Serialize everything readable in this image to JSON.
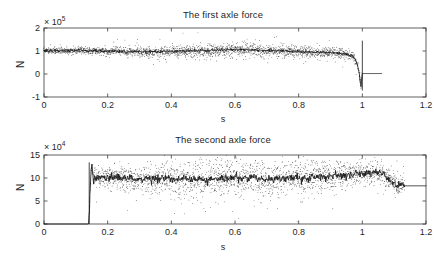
{
  "figure": {
    "width": 446,
    "height": 263,
    "background": "#ffffff",
    "line_color": "#161616",
    "dot_color": "#2b2b2b",
    "axis_color": "#3a3a3a"
  },
  "chart_data": [
    {
      "type": "line",
      "id": "first-axle-force",
      "title": "The first axle force",
      "xlabel": "s",
      "ylabel": "N",
      "y_exponent_label": "× 10",
      "y_exponent_power": "5",
      "y_exponent_value": 100000,
      "xlim": [
        0,
        1.2
      ],
      "ylim": [
        -1,
        2
      ],
      "xticks": [
        0,
        0.2,
        0.4,
        0.6,
        0.8,
        1,
        1.2
      ],
      "xticklabels": [
        "0",
        "0.2",
        "0.4",
        "0.6",
        "0.8",
        "1",
        "1.2"
      ],
      "yticks": [
        -1,
        0,
        1,
        2
      ],
      "yticklabels": [
        "-1",
        "0",
        "1",
        "2"
      ],
      "grid": false,
      "legend": null,
      "series": [
        {
          "name": "mean force",
          "style": "solid-line",
          "description": "Dense quasi-steady signal near 1.0e5 N from t=0 to t=1.0, then abrupt drop to ~0 and flat to t=1.13",
          "x": [
            0.0,
            0.005,
            0.01,
            0.015,
            0.02,
            0.025,
            0.03,
            0.035,
            0.04,
            0.045,
            0.05,
            0.055,
            0.06,
            0.065,
            0.07,
            0.075,
            0.08,
            0.085,
            0.09,
            0.095,
            0.1,
            0.105,
            0.11,
            0.115,
            0.12,
            0.125,
            0.13,
            0.135,
            0.14,
            0.145,
            0.15,
            0.16,
            0.17,
            0.18,
            0.19,
            0.2,
            0.21,
            0.22,
            0.23,
            0.24,
            0.25,
            0.26,
            0.27,
            0.28,
            0.29,
            0.3,
            0.31,
            0.32,
            0.33,
            0.34,
            0.35,
            0.36,
            0.37,
            0.38,
            0.39,
            0.4,
            0.41,
            0.42,
            0.43,
            0.44,
            0.45,
            0.46,
            0.47,
            0.48,
            0.49,
            0.5,
            0.51,
            0.52,
            0.53,
            0.54,
            0.55,
            0.56,
            0.57,
            0.58,
            0.59,
            0.6,
            0.61,
            0.62,
            0.63,
            0.64,
            0.65,
            0.66,
            0.67,
            0.68,
            0.69,
            0.7,
            0.71,
            0.72,
            0.73,
            0.74,
            0.75,
            0.76,
            0.77,
            0.78,
            0.79,
            0.8,
            0.81,
            0.82,
            0.83,
            0.84,
            0.85,
            0.86,
            0.87,
            0.88,
            0.89,
            0.9,
            0.91,
            0.92,
            0.93,
            0.94,
            0.95,
            0.96,
            0.97,
            0.975,
            0.98,
            0.985,
            0.99,
            0.993,
            0.996,
            0.998,
            1.0,
            1.002,
            1.004,
            1.006,
            1.01,
            1.02,
            1.04,
            1.06,
            1.08,
            1.1,
            1.12,
            1.133
          ],
          "y": [
            1.02,
            1.0,
            1.05,
            0.97,
            1.03,
            0.99,
            1.04,
            1.0,
            1.02,
            0.98,
            1.01,
            1.03,
            0.99,
            1.02,
            1.0,
            1.01,
            0.99,
            1.02,
            1.0,
            1.03,
            1.01,
            1.0,
            1.04,
            1.02,
            1.05,
            1.03,
            1.01,
            1.0,
            0.99,
            1.01,
            1.0,
            1.02,
            0.99,
            1.01,
            1.0,
            0.98,
            1.0,
            0.99,
            1.01,
            0.98,
            1.0,
            0.97,
            0.99,
            0.96,
            0.98,
            0.96,
            0.97,
            0.95,
            0.97,
            0.96,
            0.98,
            0.96,
            0.97,
            0.99,
            0.97,
            0.98,
            0.96,
            0.98,
            1.0,
            0.98,
            0.99,
            1.01,
            0.99,
            1.02,
            1.0,
            1.03,
            1.01,
            1.04,
            1.02,
            1.05,
            1.03,
            1.06,
            1.04,
            1.07,
            1.05,
            1.08,
            1.06,
            1.07,
            1.05,
            1.06,
            1.04,
            1.05,
            1.03,
            1.04,
            1.02,
            1.03,
            1.01,
            1.02,
            1.0,
            1.01,
            0.99,
            1.0,
            0.98,
            0.99,
            0.97,
            0.98,
            0.96,
            0.97,
            0.95,
            0.96,
            0.94,
            0.95,
            0.93,
            0.94,
            0.92,
            0.93,
            0.91,
            0.92,
            0.9,
            0.88,
            0.86,
            0.82,
            0.76,
            0.68,
            0.55,
            0.35,
            0.05,
            -0.3,
            -0.55,
            -0.15,
            0.02,
            0.02,
            0.02,
            0.02,
            0.02,
            0.02,
            0.02,
            0.02
          ],
          "scatter_band_halfwidth": 0.09,
          "scatter_note": "dotted cloud of individual samples straddles the mean line, widest (~±0.18e5) between t=0.45 and t=0.75"
        }
      ]
    },
    {
      "type": "line",
      "id": "second-axle-force",
      "title": "The second axle force",
      "xlabel": "s",
      "ylabel": "N",
      "y_exponent_label": "× 10",
      "y_exponent_power": "4",
      "y_exponent_value": 10000,
      "xlim": [
        0,
        1.2
      ],
      "ylim": [
        0,
        15
      ],
      "xticks": [
        0,
        0.2,
        0.4,
        0.6,
        0.8,
        1,
        1.2
      ],
      "xticklabels": [
        "0",
        "0.2",
        "0.4",
        "0.6",
        "0.8",
        "1",
        "1.2"
      ],
      "yticks": [
        0,
        5,
        10,
        15
      ],
      "yticklabels": [
        "0",
        "5",
        "10",
        "15"
      ],
      "grid": false,
      "legend": null,
      "series": [
        {
          "name": "mean force",
          "style": "solid-line",
          "description": "Zero until t=0.14, then abrupt rise with overshoot to ~13, settling around 9.5-10.5e4 N until t=1.13",
          "x": [
            0.0,
            0.135,
            0.14,
            0.142,
            0.145,
            0.148,
            0.15,
            0.153,
            0.156,
            0.16,
            0.165,
            0.17,
            0.175,
            0.18,
            0.19,
            0.2,
            0.21,
            0.22,
            0.23,
            0.24,
            0.25,
            0.26,
            0.27,
            0.28,
            0.29,
            0.3,
            0.31,
            0.32,
            0.33,
            0.34,
            0.35,
            0.36,
            0.37,
            0.38,
            0.39,
            0.4,
            0.41,
            0.42,
            0.43,
            0.44,
            0.45,
            0.46,
            0.47,
            0.48,
            0.49,
            0.5,
            0.51,
            0.52,
            0.53,
            0.54,
            0.55,
            0.56,
            0.57,
            0.58,
            0.59,
            0.6,
            0.61,
            0.62,
            0.63,
            0.64,
            0.65,
            0.66,
            0.67,
            0.68,
            0.69,
            0.7,
            0.71,
            0.72,
            0.73,
            0.74,
            0.75,
            0.76,
            0.77,
            0.78,
            0.79,
            0.8,
            0.81,
            0.82,
            0.83,
            0.84,
            0.85,
            0.86,
            0.87,
            0.88,
            0.89,
            0.9,
            0.91,
            0.92,
            0.93,
            0.94,
            0.95,
            0.96,
            0.97,
            0.98,
            0.99,
            1.0,
            1.01,
            1.02,
            1.03,
            1.04,
            1.05,
            1.06,
            1.07,
            1.08,
            1.09,
            1.1,
            1.11,
            1.12,
            1.125,
            1.13,
            1.133
          ],
          "y": [
            0.0,
            0.0,
            0.0,
            2.5,
            7.0,
            11.5,
            13.2,
            11.0,
            9.0,
            10.6,
            9.6,
            10.4,
            9.8,
            10.2,
            10.0,
            10.3,
            10.1,
            10.4,
            9.9,
            10.2,
            10.0,
            9.7,
            10.5,
            9.6,
            9.4,
            9.9,
            9.7,
            10.1,
            9.8,
            9.5,
            9.9,
            9.6,
            10.0,
            9.7,
            10.1,
            9.8,
            9.5,
            9.9,
            9.6,
            10.0,
            9.7,
            9.4,
            9.8,
            9.6,
            10.0,
            9.7,
            9.5,
            9.9,
            9.7,
            10.1,
            9.8,
            10.2,
            9.9,
            10.3,
            10.0,
            10.4,
            10.1,
            9.8,
            10.2,
            9.9,
            10.3,
            10.0,
            9.7,
            10.1,
            9.8,
            9.5,
            9.9,
            9.6,
            10.0,
            9.7,
            10.1,
            9.8,
            10.2,
            9.9,
            10.3,
            10.0,
            9.8,
            10.2,
            9.9,
            10.3,
            10.0,
            10.4,
            10.1,
            10.5,
            10.2,
            10.6,
            10.3,
            10.7,
            10.4,
            10.8,
            10.5,
            10.9,
            10.6,
            11.0,
            10.7,
            11.1,
            10.8,
            11.2,
            10.9,
            11.3,
            11.0,
            11.2,
            10.6,
            10.0,
            9.4,
            8.8,
            8.4,
            8.2,
            8.6,
            8.9,
            8.3
          ],
          "scatter_band_halfwidth": 1.3,
          "scatter_note": "dotted samples scatter roughly ±1.5e4 around the mean, with tall spikes up to 13e4 near t=0.33, 0.58, 0.66, 0.70, 0.80, 0.92"
        }
      ]
    }
  ]
}
